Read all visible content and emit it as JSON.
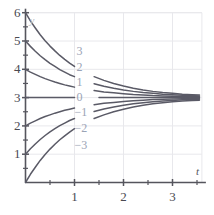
{
  "chart_data": {
    "type": "line",
    "title": "",
    "subtitle": "",
    "xlabel": "t",
    "ylabel": "y",
    "xlim": [
      0,
      3.6
    ],
    "ylim": [
      0,
      6
    ],
    "grid": true,
    "legend_position": "inline-curve-labels",
    "x_ticks_major": [
      1,
      2,
      3
    ],
    "x_ticks_major_labels": [
      "1",
      "2",
      "3"
    ],
    "x_ticks_minor": [
      0.5,
      1.5,
      2.5,
      3.5
    ],
    "y_ticks_major": [
      1,
      2,
      3,
      4,
      5,
      6
    ],
    "y_ticks_major_labels": [
      "1",
      "2",
      "3",
      "4",
      "5",
      "6"
    ],
    "y_ticks_minor": [
      0.5,
      1.5,
      2.5,
      3.5,
      4.5,
      5.5
    ],
    "asymptote": 3,
    "annotations": [
      {
        "text": "3",
        "x": 1.12,
        "y": 4.62
      },
      {
        "text": "2",
        "x": 1.12,
        "y": 4.04
      },
      {
        "text": "1",
        "x": 1.12,
        "y": 3.52
      },
      {
        "text": "0",
        "x": 1.12,
        "y": 2.98
      },
      {
        "text": "−1",
        "x": 1.08,
        "y": 2.44
      },
      {
        "text": "−2",
        "x": 1.08,
        "y": 1.88
      },
      {
        "text": "−3",
        "x": 1.08,
        "y": 1.3
      }
    ],
    "series": [
      {
        "name": "C = 3",
        "label": "3",
        "y_intercept": 6,
        "color": "#5a5a66",
        "points": [
          [
            0.0,
            6.0
          ],
          [
            0.1,
            5.71
          ],
          [
            0.2,
            5.46
          ],
          [
            0.3,
            5.22
          ],
          [
            0.4,
            5.01
          ],
          [
            0.5,
            4.82
          ],
          [
            0.6,
            4.65
          ],
          [
            0.7,
            4.49
          ],
          [
            0.8,
            4.35
          ],
          [
            0.9,
            4.22
          ],
          [
            1.0,
            4.1
          ],
          [
            1.2,
            3.9
          ],
          [
            1.4,
            3.74
          ],
          [
            1.6,
            3.61
          ],
          [
            1.8,
            3.5
          ],
          [
            2.0,
            3.41
          ],
          [
            2.2,
            3.33
          ],
          [
            2.4,
            3.27
          ],
          [
            2.6,
            3.22
          ],
          [
            2.8,
            3.18
          ],
          [
            3.0,
            3.15
          ],
          [
            3.2,
            3.12
          ],
          [
            3.4,
            3.1
          ],
          [
            3.55,
            3.09
          ]
        ]
      },
      {
        "name": "C = 2",
        "label": "2",
        "y_intercept": 5,
        "color": "#5a5a66",
        "points": [
          [
            0.0,
            5.0
          ],
          [
            0.1,
            4.81
          ],
          [
            0.2,
            4.64
          ],
          [
            0.3,
            4.48
          ],
          [
            0.4,
            4.34
          ],
          [
            0.5,
            4.21
          ],
          [
            0.6,
            4.1
          ],
          [
            0.7,
            3.99
          ],
          [
            0.8,
            3.9
          ],
          [
            0.9,
            3.81
          ],
          [
            1.0,
            3.74
          ],
          [
            1.2,
            3.6
          ],
          [
            1.4,
            3.49
          ],
          [
            1.6,
            3.4
          ],
          [
            1.8,
            3.33
          ],
          [
            2.0,
            3.27
          ],
          [
            2.2,
            3.22
          ],
          [
            2.4,
            3.18
          ],
          [
            2.6,
            3.15
          ],
          [
            2.8,
            3.12
          ],
          [
            3.0,
            3.1
          ],
          [
            3.2,
            3.08
          ],
          [
            3.4,
            3.07
          ],
          [
            3.55,
            3.06
          ]
        ]
      },
      {
        "name": "C = 1",
        "label": "1",
        "y_intercept": 4,
        "color": "#5a5a66",
        "points": [
          [
            0.0,
            4.0
          ],
          [
            0.1,
            3.9
          ],
          [
            0.2,
            3.82
          ],
          [
            0.3,
            3.74
          ],
          [
            0.4,
            3.67
          ],
          [
            0.5,
            3.61
          ],
          [
            0.6,
            3.55
          ],
          [
            0.7,
            3.5
          ],
          [
            0.8,
            3.45
          ],
          [
            0.9,
            3.41
          ],
          [
            1.0,
            3.37
          ],
          [
            1.2,
            3.3
          ],
          [
            1.4,
            3.25
          ],
          [
            1.6,
            3.2
          ],
          [
            1.8,
            3.17
          ],
          [
            2.0,
            3.14
          ],
          [
            2.2,
            3.11
          ],
          [
            2.4,
            3.09
          ],
          [
            2.6,
            3.07
          ],
          [
            2.8,
            3.06
          ],
          [
            3.0,
            3.05
          ],
          [
            3.2,
            3.04
          ],
          [
            3.4,
            3.03
          ],
          [
            3.55,
            3.03
          ]
        ]
      },
      {
        "name": "C = 0",
        "label": "0",
        "y_intercept": 3,
        "color": "#5a5a66",
        "points": [
          [
            0.0,
            3.0
          ],
          [
            0.5,
            3.0
          ],
          [
            1.0,
            3.0
          ],
          [
            1.5,
            3.0
          ],
          [
            2.0,
            3.0
          ],
          [
            2.5,
            3.0
          ],
          [
            3.0,
            3.0
          ],
          [
            3.55,
            3.0
          ]
        ]
      },
      {
        "name": "C = -1",
        "label": "−1",
        "y_intercept": 2,
        "color": "#5a5a66",
        "points": [
          [
            0.0,
            2.0
          ],
          [
            0.1,
            2.1
          ],
          [
            0.2,
            2.18
          ],
          [
            0.3,
            2.26
          ],
          [
            0.4,
            2.33
          ],
          [
            0.5,
            2.39
          ],
          [
            0.6,
            2.45
          ],
          [
            0.7,
            2.5
          ],
          [
            0.8,
            2.55
          ],
          [
            0.9,
            2.59
          ],
          [
            1.0,
            2.63
          ],
          [
            1.2,
            2.7
          ],
          [
            1.4,
            2.75
          ],
          [
            1.6,
            2.8
          ],
          [
            1.8,
            2.83
          ],
          [
            2.0,
            2.86
          ],
          [
            2.2,
            2.89
          ],
          [
            2.4,
            2.91
          ],
          [
            2.6,
            2.93
          ],
          [
            2.8,
            2.94
          ],
          [
            3.0,
            2.95
          ],
          [
            3.2,
            2.96
          ],
          [
            3.4,
            2.97
          ],
          [
            3.55,
            2.97
          ]
        ]
      },
      {
        "name": "C = -2",
        "label": "−2",
        "y_intercept": 1,
        "color": "#5a5a66",
        "points": [
          [
            0.0,
            1.0
          ],
          [
            0.1,
            1.19
          ],
          [
            0.2,
            1.36
          ],
          [
            0.3,
            1.52
          ],
          [
            0.4,
            1.66
          ],
          [
            0.5,
            1.79
          ],
          [
            0.6,
            1.9
          ],
          [
            0.7,
            2.01
          ],
          [
            0.8,
            2.1
          ],
          [
            0.9,
            2.19
          ],
          [
            1.0,
            2.26
          ],
          [
            1.2,
            2.4
          ],
          [
            1.4,
            2.51
          ],
          [
            1.6,
            2.6
          ],
          [
            1.8,
            2.67
          ],
          [
            2.0,
            2.73
          ],
          [
            2.2,
            2.78
          ],
          [
            2.4,
            2.82
          ],
          [
            2.6,
            2.85
          ],
          [
            2.8,
            2.88
          ],
          [
            3.0,
            2.9
          ],
          [
            3.2,
            2.92
          ],
          [
            3.4,
            2.93
          ],
          [
            3.55,
            2.94
          ]
        ]
      },
      {
        "name": "C = -3",
        "label": "−3",
        "y_intercept": 0,
        "color": "#5a5a66",
        "points": [
          [
            0.0,
            0.0
          ],
          [
            0.1,
            0.29
          ],
          [
            0.2,
            0.54
          ],
          [
            0.3,
            0.78
          ],
          [
            0.4,
            0.99
          ],
          [
            0.5,
            1.18
          ],
          [
            0.6,
            1.35
          ],
          [
            0.7,
            1.51
          ],
          [
            0.8,
            1.65
          ],
          [
            0.9,
            1.78
          ],
          [
            1.0,
            1.9
          ],
          [
            1.2,
            2.1
          ],
          [
            1.4,
            2.26
          ],
          [
            1.6,
            2.39
          ],
          [
            1.8,
            2.5
          ],
          [
            2.0,
            2.59
          ],
          [
            2.2,
            2.67
          ],
          [
            2.4,
            2.73
          ],
          [
            2.6,
            2.78
          ],
          [
            2.8,
            2.82
          ],
          [
            3.0,
            2.85
          ],
          [
            3.2,
            2.88
          ],
          [
            3.4,
            2.9
          ],
          [
            3.55,
            2.91
          ]
        ]
      }
    ],
    "colors": {
      "curve": "#5a5a66",
      "axis": "#55555d",
      "grid": "#e8e8ec",
      "tick_label": "#4a4a52",
      "curve_label": "#9aa3b5",
      "background": "#ffffff"
    }
  },
  "axis_labels": {
    "x_name": "t",
    "y_name": "y"
  }
}
